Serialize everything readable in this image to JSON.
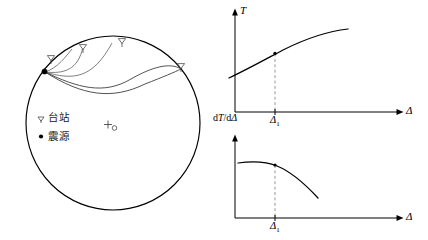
{
  "figure": {
    "title": "",
    "globe": {
      "name": "earth-cross-section",
      "center_marker": "+",
      "center_subscript": "∘",
      "legend": [
        {
          "symbol": "triangle-down",
          "label": "台站"
        },
        {
          "symbol": "filled-dot",
          "label": "震源"
        }
      ],
      "stations": [
        {
          "id": "station-1",
          "label": "▽"
        },
        {
          "id": "station-2",
          "label": "▽"
        },
        {
          "id": "station-3",
          "label": "▽"
        },
        {
          "id": "station-4",
          "label": "▽"
        }
      ],
      "source": {
        "id": "earthquake-source",
        "label": "●"
      }
    },
    "charts": [
      {
        "id": "travel-time-chart",
        "type": "line",
        "title": "",
        "ylabel": "T",
        "xlabel": "Δ",
        "tick_label": "Δ",
        "tick_subscript": "1",
        "grid": false,
        "legend": "none",
        "annotation": "marked point at Δ₁",
        "x": [
          0.0,
          0.1,
          0.2,
          0.3,
          0.4,
          0.5,
          0.6,
          0.7,
          0.8,
          0.9,
          1.0
        ],
        "y": [
          0.14,
          0.26,
          0.37,
          0.47,
          0.56,
          0.64,
          0.71,
          0.77,
          0.82,
          0.86,
          0.88
        ],
        "marked_point": {
          "x": 0.355,
          "y": 0.515
        },
        "xlim": [
          0,
          1.15
        ],
        "ylim": [
          0,
          1.0
        ]
      },
      {
        "id": "slowness-chart",
        "type": "line",
        "title": "",
        "ylabel": "dT/dΔ",
        "xlabel": "Δ",
        "tick_label": "Δ",
        "tick_subscript": "1",
        "grid": false,
        "legend": "none",
        "annotation": "marked point at Δ₁",
        "x": [
          0.0,
          0.1,
          0.2,
          0.3,
          0.4,
          0.5,
          0.6,
          0.7,
          0.8,
          0.9
        ],
        "y": [
          0.86,
          0.87,
          0.875,
          0.865,
          0.835,
          0.785,
          0.715,
          0.63,
          0.535,
          0.43
        ],
        "marked_point": {
          "x": 0.355,
          "y": 0.848
        },
        "xlim": [
          0,
          1.15
        ],
        "ylim": [
          0,
          1.0
        ]
      }
    ]
  }
}
